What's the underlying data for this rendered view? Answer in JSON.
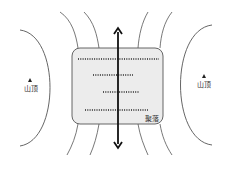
{
  "diagram": {
    "type": "terrain-settlement-sketch",
    "labels": {
      "left_peak": "山顶",
      "right_peak": "山顶",
      "settlement": "聚落"
    },
    "colors": {
      "settlement_fill": "#ececec",
      "settlement_border": "#555555",
      "contour": "#555555",
      "arrow": "#111111",
      "dots": "#222222"
    }
  }
}
